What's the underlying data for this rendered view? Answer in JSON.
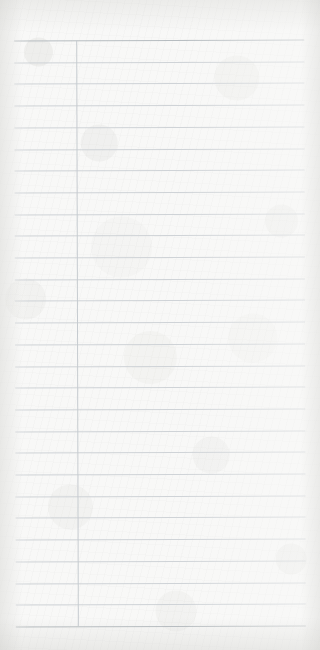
{
  "document": {
    "kind": "blank-ruled-paper-scan",
    "title": "",
    "body_text": "",
    "visible_text": "",
    "page_width": 320,
    "page_height": 650
  },
  "colors": {
    "paper": "#f8f8f7",
    "rule_line": "#ccd1d5",
    "rule_line_strong": "#b2b8bd",
    "vertical_rule": "#c6cbd0",
    "edge_shadow": "#c4c4c0"
  },
  "ruling": {
    "horizontal_line_count": 28,
    "first_line_y": 40,
    "line_spacing": 21.7,
    "line_left_x": 15,
    "line_right_x": 305,
    "strong_line_indices": [
      0,
      27
    ],
    "rows": [
      {
        "index": 0,
        "y": 40.0,
        "label": ""
      },
      {
        "index": 1,
        "y": 61.7,
        "label": ""
      },
      {
        "index": 2,
        "y": 83.4,
        "label": ""
      },
      {
        "index": 3,
        "y": 105.1,
        "label": ""
      },
      {
        "index": 4,
        "y": 126.8,
        "label": ""
      },
      {
        "index": 5,
        "y": 148.5,
        "label": ""
      },
      {
        "index": 6,
        "y": 170.2,
        "label": ""
      },
      {
        "index": 7,
        "y": 191.9,
        "label": ""
      },
      {
        "index": 8,
        "y": 213.6,
        "label": ""
      },
      {
        "index": 9,
        "y": 235.3,
        "label": ""
      },
      {
        "index": 10,
        "y": 257.0,
        "label": ""
      },
      {
        "index": 11,
        "y": 278.7,
        "label": ""
      },
      {
        "index": 12,
        "y": 300.4,
        "label": ""
      },
      {
        "index": 13,
        "y": 322.1,
        "label": ""
      },
      {
        "index": 14,
        "y": 343.8,
        "label": ""
      },
      {
        "index": 15,
        "y": 365.5,
        "label": ""
      },
      {
        "index": 16,
        "y": 387.2,
        "label": ""
      },
      {
        "index": 17,
        "y": 408.9,
        "label": ""
      },
      {
        "index": 18,
        "y": 430.6,
        "label": ""
      },
      {
        "index": 19,
        "y": 452.3,
        "label": ""
      },
      {
        "index": 20,
        "y": 474.0,
        "label": ""
      },
      {
        "index": 21,
        "y": 495.7,
        "label": ""
      },
      {
        "index": 22,
        "y": 517.4,
        "label": ""
      },
      {
        "index": 23,
        "y": 539.1,
        "label": ""
      },
      {
        "index": 24,
        "y": 560.8,
        "label": ""
      },
      {
        "index": 25,
        "y": 582.5,
        "label": ""
      },
      {
        "index": 26,
        "y": 604.2,
        "label": ""
      },
      {
        "index": 27,
        "y": 626.0,
        "label": ""
      }
    ],
    "vertical_rules": [
      {
        "index": 0,
        "x": 77,
        "y_start": 40,
        "y_end": 626,
        "label": ""
      }
    ]
  }
}
